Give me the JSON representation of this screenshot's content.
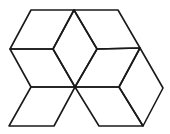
{
  "figure": {
    "stroke_color": "#1a1a1a",
    "background": "#ffffff",
    "shapes": [
      {
        "name": "rhombus-top-left",
        "points": [
          [
            31,
            10
          ],
          [
            74,
            10
          ],
          [
            53,
            49
          ],
          [
            10,
            49
          ]
        ]
      },
      {
        "name": "rhombus-top-center",
        "points": [
          [
            74,
            10
          ],
          [
            97,
            49
          ],
          [
            75,
            87
          ],
          [
            53,
            49
          ]
        ]
      },
      {
        "name": "rhombus-top-right",
        "points": [
          [
            74,
            10
          ],
          [
            118,
            10
          ],
          [
            140,
            48
          ],
          [
            97,
            49
          ]
        ]
      },
      {
        "name": "rhombus-mid-left",
        "points": [
          [
            10,
            49
          ],
          [
            53,
            49
          ],
          [
            75,
            87
          ],
          [
            31,
            87
          ]
        ]
      },
      {
        "name": "rhombus-mid-right",
        "points": [
          [
            97,
            49
          ],
          [
            140,
            48
          ],
          [
            119,
            87
          ],
          [
            75,
            87
          ]
        ]
      },
      {
        "name": "rhombus-far-right",
        "points": [
          [
            140,
            48
          ],
          [
            163,
            88
          ],
          [
            143,
            126
          ],
          [
            119,
            87
          ]
        ]
      },
      {
        "name": "rhombus-bottom-left",
        "points": [
          [
            31,
            87
          ],
          [
            75,
            87
          ],
          [
            54,
            126
          ],
          [
            9,
            126
          ]
        ]
      },
      {
        "name": "rhombus-bottom-right",
        "points": [
          [
            75,
            87
          ],
          [
            119,
            87
          ],
          [
            143,
            126
          ],
          [
            99,
            126
          ]
        ]
      }
    ]
  }
}
